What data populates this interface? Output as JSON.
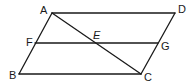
{
  "figure": {
    "type": "geometry",
    "points": {
      "A": {
        "label": "A",
        "x": 52,
        "y": 13,
        "lx": 40,
        "ly": 14
      },
      "D": {
        "label": "D",
        "x": 175,
        "y": 13,
        "lx": 178,
        "ly": 13
      },
      "F": {
        "label": "F",
        "x": 35,
        "y": 43,
        "lx": 26,
        "ly": 46
      },
      "E": {
        "label": "E",
        "x": 97,
        "y": 43,
        "lx": 93,
        "ly": 39
      },
      "G": {
        "label": "G",
        "x": 158,
        "y": 43,
        "lx": 161,
        "ly": 50
      },
      "B": {
        "label": "B",
        "x": 19,
        "y": 74,
        "lx": 9,
        "ly": 79
      },
      "C": {
        "label": "C",
        "x": 141,
        "y": 74,
        "lx": 144,
        "ly": 81
      }
    },
    "segments": [
      {
        "name": "segment-ad",
        "from": "A",
        "to": "D"
      },
      {
        "name": "segment-ab",
        "from": "A",
        "to": "B"
      },
      {
        "name": "segment-bc",
        "from": "B",
        "to": "C"
      },
      {
        "name": "segment-dc",
        "from": "D",
        "to": "C"
      },
      {
        "name": "segment-fg",
        "from": "F",
        "to": "G"
      },
      {
        "name": "segment-ac",
        "from": "A",
        "to": "C"
      }
    ],
    "line_color": "#1a1a1a"
  }
}
